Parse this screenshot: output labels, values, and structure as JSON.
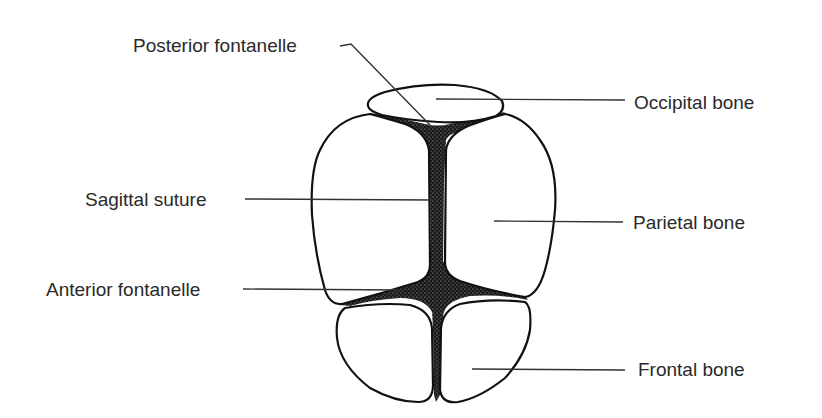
{
  "diagram": {
    "colors": {
      "background": "#ffffff",
      "outline": "#111111",
      "suture_fill": "#1a1a1a",
      "label_text": "#2a2a2a",
      "leader_line": "#333333"
    },
    "labels": {
      "posterior_fontanelle": "Posterior fontanelle",
      "sagittal_suture": "Sagittal suture",
      "anterior_fontanelle": "Anterior fontanelle",
      "occipital_bone": "Occipital bone",
      "parietal_bone": "Parietal bone",
      "frontal_bone": "Frontal bone"
    },
    "structures": [
      {
        "id": "occipital-bone",
        "label": "Occipital bone",
        "side": "right"
      },
      {
        "id": "posterior-fontanelle",
        "label": "Posterior fontanelle",
        "side": "left"
      },
      {
        "id": "sagittal-suture",
        "label": "Sagittal suture",
        "side": "left"
      },
      {
        "id": "parietal-bone",
        "label": "Parietal bone",
        "side": "right"
      },
      {
        "id": "anterior-fontanelle",
        "label": "Anterior fontanelle",
        "side": "left"
      },
      {
        "id": "frontal-bone",
        "label": "Frontal bone",
        "side": "right"
      }
    ]
  }
}
